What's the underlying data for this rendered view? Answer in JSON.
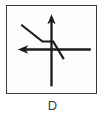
{
  "figure": {
    "caption": "D",
    "label_letter": "D",
    "frame": {
      "border_color": "#3b3b3b",
      "background_color": "#fdfdfd"
    }
  },
  "chart_data": {
    "type": "line",
    "title": "",
    "subtitle": "",
    "xlabel": "",
    "ylabel": "",
    "caption": "D",
    "grid": false,
    "legend": null,
    "tick_labels": {
      "x": [],
      "y": []
    },
    "xlim": [
      -1,
      1
    ],
    "ylim": [
      -1,
      1
    ],
    "axes": {
      "origin": [
        0,
        0
      ],
      "x_axis": {
        "name": "horizontal-axis",
        "from": [
          -0.82,
          0
        ],
        "to": [
          0.96,
          0
        ],
        "arrow_start": true,
        "arrow_end": false,
        "arrow_direction": "left"
      },
      "y_axis": {
        "name": "vertical-axis",
        "from": [
          0,
          -0.92
        ],
        "to": [
          0,
          0.88
        ],
        "arrow_start": false,
        "arrow_end": true,
        "arrow_direction": "up"
      }
    },
    "series": [
      {
        "name": "piecewise-step-curve",
        "shape": "piecewise-linear-with-flat-middle",
        "color": "#1a1a1a",
        "line_width": 2.4,
        "points": [
          [
            -0.74,
            0.62
          ],
          [
            -0.22,
            0.2
          ],
          [
            0.04,
            0.2
          ],
          [
            0.3,
            -0.24
          ]
        ],
        "segments": [
          {
            "type": "descending-diagonal",
            "from": [
              -0.74,
              0.62
            ],
            "to": [
              -0.22,
              0.2
            ]
          },
          {
            "type": "horizontal-flat",
            "from": [
              -0.22,
              0.2
            ],
            "to": [
              0.04,
              0.2
            ]
          },
          {
            "type": "descending-diagonal",
            "from": [
              0.04,
              0.2
            ],
            "to": [
              0.3,
              -0.24
            ]
          }
        ],
        "crosses_origin": true
      }
    ],
    "annotations": []
  }
}
